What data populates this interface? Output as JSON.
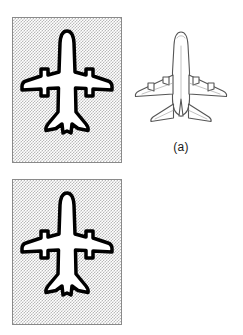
{
  "figure": {
    "background_color": "#ffffff",
    "panel_fill_color": "#d8d8d8",
    "panel_border_color": "#8a8a8a",
    "outline_color": "#000000",
    "lineart_color": "#555555"
  },
  "rows": [
    {
      "id": "a",
      "caption": "(a)",
      "panel": {
        "name": "gray-stipple-panel",
        "fill": "stippled-gray",
        "content": "aircraft-silhouette-top-view"
      },
      "silhouette": {
        "name": "aircraft-silhouette",
        "orientation_degrees": 0,
        "view": "top",
        "engine_count": 4,
        "fill": "#ffffff",
        "stroke": "#000000"
      },
      "lineart": {
        "name": "aircraft-line-drawing",
        "orientation_degrees": 0,
        "view": "top",
        "engine_count": 4,
        "stroke": "#555555"
      }
    },
    {
      "id": "b",
      "caption": "(b)",
      "panel": {
        "name": "gray-stipple-panel",
        "fill": "stippled-gray",
        "content": "aircraft-silhouette-top-view"
      },
      "silhouette": {
        "name": "aircraft-silhouette",
        "orientation_degrees": 0,
        "view": "top",
        "engine_count": 4,
        "fill": "#ffffff",
        "stroke": "#000000"
      },
      "lineart": {
        "name": "aircraft-line-drawing",
        "orientation_degrees": -48,
        "view": "top",
        "engine_count": 4,
        "stroke": "#555555"
      }
    }
  ]
}
